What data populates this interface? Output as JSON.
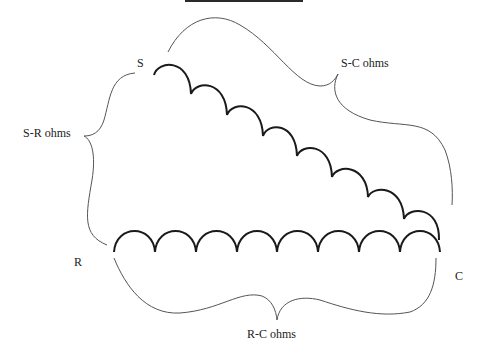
{
  "diagram": {
    "type": "motor-winding-resistance",
    "terminals": {
      "s": "S",
      "r": "R",
      "c": "C"
    },
    "measurements": {
      "s_r": "S-R ohms",
      "s_c": "S-C ohms",
      "r_c": "R-C ohms"
    },
    "windings": [
      {
        "name": "start-winding",
        "from": "S",
        "to": "C",
        "humps": 8
      },
      {
        "name": "run-winding",
        "from": "R",
        "to": "C",
        "humps": 8
      }
    ],
    "colors": {
      "coil": "#1a1a1a",
      "brace": "#555555",
      "text": "#222222"
    }
  }
}
